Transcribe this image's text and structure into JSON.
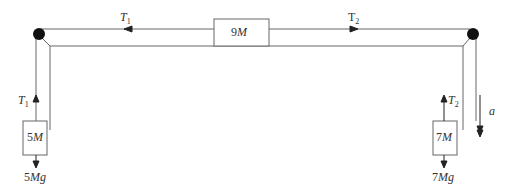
{
  "diagram": {
    "title": "",
    "blocks": {
      "top": {
        "label_num": "9",
        "label_var": "M"
      },
      "left": {
        "label_num": "5",
        "label_var": "M"
      },
      "right": {
        "label_num": "7",
        "label_var": "M"
      }
    },
    "tensions": {
      "t1_top": {
        "var": "T",
        "sub": "1"
      },
      "t2_top": {
        "var": "T",
        "sub": "2"
      },
      "t1_left": {
        "var": "T",
        "sub": "1"
      },
      "t2_right": {
        "var": "T",
        "sub": "2"
      }
    },
    "weights": {
      "left": {
        "num": "5",
        "var": "Mg"
      },
      "right": {
        "num": "7",
        "var": "Mg"
      }
    },
    "acceleration": {
      "var": "a"
    },
    "colors": {
      "line": "#555555",
      "pulley": "#111111",
      "text": "#333333"
    }
  }
}
